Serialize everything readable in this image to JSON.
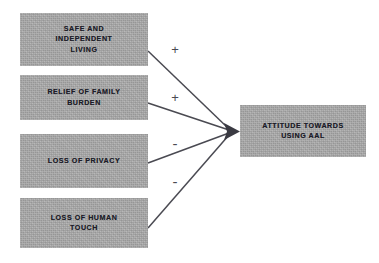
{
  "diagram": {
    "type": "conceptual-path-model",
    "outcome": {
      "id": "attitude-towards-aal",
      "label": "ATTITUDE TOWARDS\nUSING AAL"
    },
    "determinants": [
      {
        "id": "safe-independent-living",
        "label": "SAFE AND\nINDEPENDENT\nLIVING",
        "sign": "+",
        "sign_name": "plus"
      },
      {
        "id": "relief-family-burden",
        "label": "RELIEF OF FAMILY\nBURDEN",
        "sign": "+",
        "sign_name": "plus"
      },
      {
        "id": "loss-privacy",
        "label": "LOSS OF PRIVACY",
        "sign": "-",
        "sign_name": "minus"
      },
      {
        "id": "loss-human-touch",
        "label": "LOSS OF HUMAN\nTOUCH",
        "sign": "-",
        "sign_name": "minus"
      }
    ],
    "colors": {
      "box_fill": "#ababab",
      "box_text": "#1c1c28",
      "connector": "#4a4a52",
      "background": "#ffffff"
    }
  }
}
